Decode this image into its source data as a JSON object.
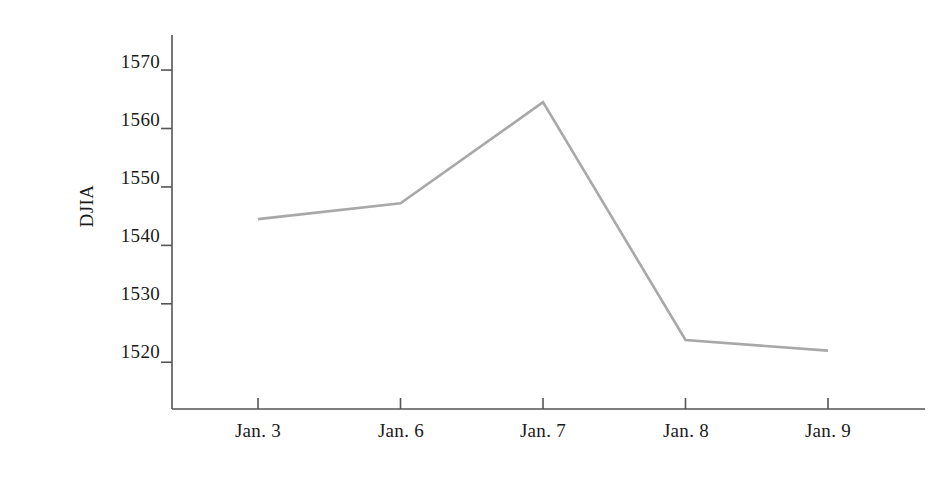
{
  "chart_data": {
    "type": "line",
    "title": "",
    "xlabel": "",
    "ylabel": "DJIA",
    "categories": [
      "Jan. 3",
      "Jan. 6",
      "Jan. 7",
      "Jan. 8",
      "Jan. 9"
    ],
    "values": [
      1544.5,
      1547.2,
      1564.5,
      1523.8,
      1522.0
    ],
    "series": [
      {
        "name": "DJIA",
        "values": [
          1544.5,
          1547.2,
          1564.5,
          1523.8,
          1522.0
        ],
        "color": "#a8a8a8"
      }
    ],
    "ylim": [
      1512,
      1576
    ],
    "yticks": [
      1520,
      1530,
      1540,
      1550,
      1560,
      1570
    ],
    "ytick_labels": [
      "1520",
      "1530",
      "1540",
      "1550",
      "1560",
      "1570"
    ],
    "xtick_labels": [
      "Jan. 3",
      "Jan. 6",
      "Jan. 7",
      "Jan. 8",
      "Jan. 9"
    ],
    "grid": false,
    "legend": "none",
    "axis_color": "#555555",
    "line_color": "#a8a8a8",
    "text_color": "#1a1a1a",
    "background": "#ffffff"
  },
  "axes": {
    "y_title": "DJIA",
    "y_labels": [
      "1570",
      "1560",
      "1550",
      "1540",
      "1530",
      "1520"
    ],
    "x_labels": [
      "Jan. 3",
      "Jan. 6",
      "Jan. 7",
      "Jan. 8",
      "Jan. 9"
    ]
  }
}
